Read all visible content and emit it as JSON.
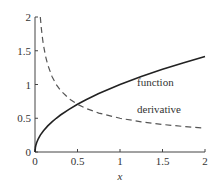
{
  "chart_data": {
    "type": "line",
    "title": "",
    "xlabel": "x",
    "ylabel": "",
    "xlim": [
      0,
      2
    ],
    "ylim": [
      0,
      2
    ],
    "grid": false,
    "legend": "inline labels",
    "x_ticks": [
      0,
      0.5,
      1,
      1.5,
      2
    ],
    "x_tick_labels": [
      "0",
      "0.5",
      "1",
      "1.5",
      "2"
    ],
    "y_ticks": [
      0,
      0.5,
      1,
      1.5,
      2
    ],
    "y_tick_labels": [
      "0",
      "0.5",
      "1",
      "1.5",
      "2"
    ],
    "x": [
      0.0625,
      0.1,
      0.125,
      0.15,
      0.2,
      0.25,
      0.3,
      0.4,
      0.5,
      0.6,
      0.75,
      1.0,
      1.25,
      1.5,
      1.75,
      2.0
    ],
    "series": [
      {
        "name": "function",
        "style": "solid",
        "color": "#222222",
        "x": [
          0,
          0.005,
          0.01,
          0.02,
          0.04,
          0.0625,
          0.1,
          0.15,
          0.2,
          0.25,
          0.3,
          0.4,
          0.5,
          0.6,
          0.75,
          1.0,
          1.25,
          1.5,
          1.75,
          2.0
        ],
        "values": [
          0,
          0.071,
          0.1,
          0.141,
          0.2,
          0.25,
          0.316,
          0.387,
          0.447,
          0.5,
          0.548,
          0.632,
          0.707,
          0.775,
          0.866,
          1.0,
          1.118,
          1.225,
          1.323,
          1.414
        ]
      },
      {
        "name": "derivative",
        "style": "dashed",
        "color": "#555555",
        "x": [
          0.0625,
          0.075,
          0.09,
          0.1,
          0.125,
          0.15,
          0.2,
          0.25,
          0.3,
          0.4,
          0.5,
          0.6,
          0.75,
          1.0,
          1.25,
          1.5,
          1.75,
          2.0
        ],
        "values": [
          2.0,
          1.826,
          1.667,
          1.581,
          1.414,
          1.291,
          1.118,
          1.0,
          0.913,
          0.791,
          0.707,
          0.645,
          0.577,
          0.5,
          0.447,
          0.408,
          0.378,
          0.354
        ]
      }
    ],
    "annotations": [
      {
        "text": "function",
        "x": 1.2,
        "y": 0.98
      },
      {
        "text": "derivative",
        "x": 1.2,
        "y": 0.58
      }
    ]
  },
  "layout": {
    "origin_px": [
      35,
      152
    ],
    "px_per_x": 85,
    "px_per_y": 67.5
  }
}
